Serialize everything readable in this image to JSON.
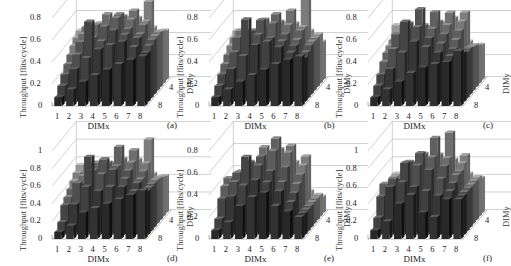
{
  "figure": {
    "panels": [
      {
        "id": "a",
        "label": "(a)",
        "ylabel": "Throughput  [flits/cycle]",
        "xlabel": "DIMx",
        "zlabel": "DIMy",
        "yticks": [
          "0",
          "0.2",
          "0.4",
          "0.6",
          "0.8"
        ],
        "ymax": 0.8,
        "xticks": [
          "1",
          "2",
          "3",
          "4",
          "5",
          "6",
          "7",
          "8"
        ],
        "zticks": [
          "4",
          "8"
        ]
      },
      {
        "id": "b",
        "label": "(b)",
        "ylabel": "Throughput  [flits/cycle]",
        "xlabel": "DIMx",
        "zlabel": "DIMy",
        "yticks": [
          "0",
          "0.2",
          "0.4",
          "0.6",
          "0.8"
        ],
        "ymax": 0.8,
        "xticks": [
          "1",
          "2",
          "3",
          "4",
          "5",
          "6",
          "7",
          "8"
        ],
        "zticks": [
          "4",
          "8"
        ]
      },
      {
        "id": "c",
        "label": "(c)",
        "ylabel": "Throughput  [flits/cycle]",
        "xlabel": "DIMx",
        "zlabel": "DIMy",
        "yticks": [
          "0",
          "0.2",
          "0.4",
          "0.6",
          "0.8"
        ],
        "ymax": 0.8,
        "xticks": [
          "1",
          "2",
          "3",
          "4",
          "5",
          "6",
          "7",
          "8"
        ],
        "zticks": [
          "4",
          "8"
        ]
      },
      {
        "id": "d",
        "label": "(d)",
        "ylabel": "Throughput  [flits/cycle]",
        "xlabel": "DIMx",
        "zlabel": "DIMy",
        "yticks": [
          "0",
          "0.2",
          "0.4",
          "0.6",
          "0.8",
          "1"
        ],
        "ymax": 1.0,
        "xticks": [
          "1",
          "2",
          "3",
          "4",
          "5",
          "6",
          "7",
          "8"
        ],
        "zticks": [
          "4",
          "8"
        ]
      },
      {
        "id": "e",
        "label": "(e)",
        "ylabel": "Throughput  [flits/cycle]",
        "xlabel": "DIMx",
        "zlabel": "DIMy",
        "yticks": [
          "0",
          "0.2",
          "0.4",
          "0.6",
          "0.8"
        ],
        "ymax": 0.8,
        "xticks": [
          "1",
          "2",
          "3",
          "4",
          "5",
          "6",
          "7",
          "8"
        ],
        "zticks": [
          "4",
          "8"
        ]
      },
      {
        "id": "f",
        "label": "(f)",
        "ylabel": "Throughput  [flits/cycle]",
        "xlabel": "DIMx",
        "zlabel": "DIMy",
        "yticks": [
          "0",
          "0.2",
          "0.4",
          "0.6",
          "0.8",
          "1"
        ],
        "ymax": 1.0,
        "xticks": [
          "1",
          "2",
          "3",
          "4",
          "5",
          "6",
          "7",
          "8"
        ],
        "zticks": [
          "4",
          "8"
        ]
      }
    ]
  },
  "chart_data": [
    {
      "type": "bar",
      "subtype": "3d-bar",
      "title": "(a)",
      "xlabel": "DIMx",
      "ylabel": "Throughput [flits/cycle]",
      "zlabel": "DIMy",
      "ylim": [
        0,
        0.8
      ],
      "x": [
        1,
        2,
        3,
        4,
        5,
        6,
        7,
        8
      ],
      "z": [
        1,
        2,
        3,
        4,
        5,
        6,
        7,
        8
      ],
      "values": [
        [
          0.08,
          0.15,
          0.22,
          0.28,
          0.33,
          0.38,
          0.42,
          0.45
        ],
        [
          0.15,
          0.3,
          0.4,
          0.48,
          0.52,
          0.55,
          0.5,
          0.45
        ],
        [
          0.22,
          0.4,
          0.7,
          0.52,
          0.62,
          0.58,
          0.55,
          0.48
        ],
        [
          0.28,
          0.48,
          0.52,
          0.62,
          0.7,
          0.6,
          0.55,
          0.5
        ],
        [
          0.33,
          0.52,
          0.6,
          0.7,
          0.7,
          0.65,
          0.6,
          0.5
        ],
        [
          0.38,
          0.55,
          0.58,
          0.6,
          0.65,
          0.7,
          0.6,
          0.5
        ],
        [
          0.42,
          0.5,
          0.55,
          0.55,
          0.6,
          0.6,
          0.75,
          0.48
        ],
        [
          0.45,
          0.45,
          0.48,
          0.5,
          0.5,
          0.5,
          0.48,
          0.45
        ]
      ]
    },
    {
      "type": "bar",
      "subtype": "3d-bar",
      "title": "(b)",
      "xlabel": "DIMx",
      "ylabel": "Throughput [flits/cycle]",
      "zlabel": "DIMy",
      "ylim": [
        0,
        0.8
      ],
      "x": [
        1,
        2,
        3,
        4,
        5,
        6,
        7,
        8
      ],
      "z": [
        1,
        2,
        3,
        4,
        5,
        6,
        7,
        8
      ],
      "values": [
        [
          0.08,
          0.15,
          0.22,
          0.28,
          0.33,
          0.38,
          0.42,
          0.45
        ],
        [
          0.15,
          0.3,
          0.42,
          0.52,
          0.55,
          0.5,
          0.45,
          0.4
        ],
        [
          0.22,
          0.42,
          0.72,
          0.58,
          0.55,
          0.52,
          0.48,
          0.42
        ],
        [
          0.28,
          0.52,
          0.58,
          0.68,
          0.65,
          0.55,
          0.5,
          0.45
        ],
        [
          0.33,
          0.55,
          0.55,
          0.65,
          0.7,
          0.6,
          0.55,
          0.45
        ],
        [
          0.38,
          0.5,
          0.52,
          0.55,
          0.6,
          0.7,
          0.55,
          0.45
        ],
        [
          0.42,
          0.45,
          0.48,
          0.5,
          0.55,
          0.55,
          0.78,
          0.45
        ],
        [
          0.45,
          0.4,
          0.42,
          0.45,
          0.45,
          0.45,
          0.45,
          0.35
        ]
      ]
    },
    {
      "type": "bar",
      "subtype": "3d-bar",
      "title": "(c)",
      "xlabel": "DIMx",
      "ylabel": "Throughput [flits/cycle]",
      "zlabel": "DIMy",
      "ylim": [
        0,
        0.8
      ],
      "x": [
        1,
        2,
        3,
        4,
        5,
        6,
        7,
        8
      ],
      "z": [
        1,
        2,
        3,
        4,
        5,
        6,
        7,
        8
      ],
      "values": [
        [
          0.08,
          0.15,
          0.22,
          0.3,
          0.35,
          0.38,
          0.4,
          0.5
        ],
        [
          0.15,
          0.3,
          0.45,
          0.55,
          0.5,
          0.45,
          0.42,
          0.45
        ],
        [
          0.22,
          0.45,
          0.7,
          0.65,
          0.55,
          0.5,
          0.45,
          0.42
        ],
        [
          0.3,
          0.55,
          0.65,
          0.78,
          0.6,
          0.55,
          0.5,
          0.42
        ],
        [
          0.35,
          0.5,
          0.55,
          0.6,
          0.72,
          0.6,
          0.55,
          0.4
        ],
        [
          0.38,
          0.45,
          0.5,
          0.55,
          0.6,
          0.68,
          0.6,
          0.38
        ],
        [
          0.4,
          0.42,
          0.45,
          0.5,
          0.55,
          0.6,
          0.65,
          0.35
        ],
        [
          0.5,
          0.45,
          0.42,
          0.42,
          0.4,
          0.38,
          0.35,
          0.32
        ]
      ]
    },
    {
      "type": "bar",
      "subtype": "3d-bar",
      "title": "(d)",
      "xlabel": "DIMx",
      "ylabel": "Throughput [flits/cycle]",
      "zlabel": "DIMy",
      "ylim": [
        0,
        1
      ],
      "x": [
        1,
        2,
        3,
        4,
        5,
        6,
        7,
        8
      ],
      "z": [
        1,
        2,
        3,
        4,
        5,
        6,
        7,
        8
      ],
      "values": [
        [
          0.08,
          0.15,
          0.3,
          0.35,
          0.4,
          0.45,
          0.5,
          0.55
        ],
        [
          0.15,
          0.35,
          0.55,
          0.5,
          0.55,
          0.55,
          0.5,
          0.5
        ],
        [
          0.3,
          0.55,
          0.85,
          0.65,
          0.7,
          0.6,
          0.55,
          0.5
        ],
        [
          0.35,
          0.5,
          0.65,
          0.78,
          0.7,
          0.65,
          0.55,
          0.5
        ],
        [
          0.4,
          0.55,
          0.7,
          0.7,
          0.88,
          0.7,
          0.6,
          0.5
        ],
        [
          0.45,
          0.55,
          0.6,
          0.65,
          0.7,
          0.8,
          0.65,
          0.48
        ],
        [
          0.5,
          0.5,
          0.55,
          0.55,
          0.6,
          0.65,
          0.88,
          0.45
        ],
        [
          0.55,
          0.5,
          0.5,
          0.5,
          0.5,
          0.48,
          0.45,
          0.42
        ]
      ]
    },
    {
      "type": "bar",
      "subtype": "3d-bar",
      "title": "(e)",
      "xlabel": "DIMx",
      "ylabel": "Throughput [flits/cycle]",
      "zlabel": "DIMy",
      "ylim": [
        0,
        0.8
      ],
      "x": [
        1,
        2,
        3,
        4,
        5,
        6,
        7,
        8
      ],
      "z": [
        1,
        2,
        3,
        4,
        5,
        6,
        7,
        8
      ],
      "values": [
        [
          0.08,
          0.15,
          0.3,
          0.38,
          0.42,
          0.3,
          0.25,
          0.2
        ],
        [
          0.15,
          0.35,
          0.45,
          0.5,
          0.48,
          0.4,
          0.3,
          0.2
        ],
        [
          0.3,
          0.45,
          0.68,
          0.6,
          0.55,
          0.45,
          0.35,
          0.2
        ],
        [
          0.38,
          0.5,
          0.6,
          0.65,
          0.7,
          0.55,
          0.4,
          0.2
        ],
        [
          0.42,
          0.48,
          0.55,
          0.7,
          0.78,
          0.65,
          0.45,
          0.2
        ],
        [
          0.3,
          0.4,
          0.45,
          0.55,
          0.65,
          0.68,
          0.5,
          0.2
        ],
        [
          0.25,
          0.3,
          0.35,
          0.4,
          0.45,
          0.5,
          0.55,
          0.2
        ],
        [
          0.2,
          0.2,
          0.2,
          0.2,
          0.2,
          0.2,
          0.2,
          0.15
        ]
      ]
    },
    {
      "type": "bar",
      "subtype": "3d-bar",
      "title": "(f)",
      "xlabel": "DIMx",
      "ylabel": "Throughput [flits/cycle]",
      "zlabel": "DIMy",
      "ylim": [
        0,
        1
      ],
      "x": [
        1,
        2,
        3,
        4,
        5,
        6,
        7,
        8
      ],
      "z": [
        1,
        2,
        3,
        4,
        5,
        6,
        7,
        8
      ],
      "values": [
        [
          0.1,
          0.2,
          0.4,
          0.5,
          0.3,
          0.25,
          0.45,
          0.45
        ],
        [
          0.2,
          0.55,
          0.6,
          0.55,
          0.5,
          0.45,
          0.5,
          0.45
        ],
        [
          0.4,
          0.6,
          0.78,
          0.75,
          0.7,
          0.6,
          0.55,
          0.45
        ],
        [
          0.5,
          0.55,
          0.75,
          0.85,
          0.8,
          0.7,
          0.6,
          0.45
        ],
        [
          0.3,
          0.5,
          0.7,
          0.8,
          0.98,
          0.75,
          0.6,
          0.45
        ],
        [
          0.25,
          0.45,
          0.6,
          0.7,
          0.75,
          1.0,
          0.65,
          0.45
        ],
        [
          0.45,
          0.5,
          0.55,
          0.6,
          0.6,
          0.65,
          0.7,
          0.45
        ],
        [
          0.45,
          0.45,
          0.45,
          0.45,
          0.45,
          0.45,
          0.45,
          0.4
        ]
      ]
    }
  ]
}
